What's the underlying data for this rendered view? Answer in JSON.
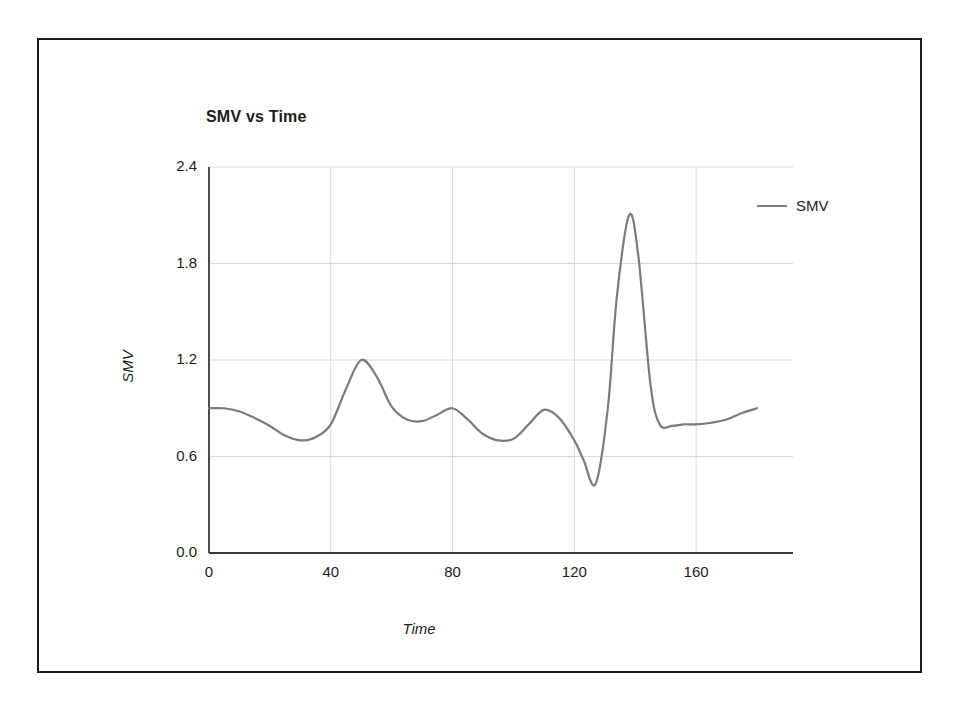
{
  "figure": {
    "title": "SMV vs Time",
    "legend": {
      "position": "top-right",
      "entries": [
        {
          "label": "SMV",
          "color": "#7b7b7b",
          "marker": "line-swatch"
        }
      ]
    }
  },
  "chart_data": {
    "type": "line",
    "title": "SMV vs Time",
    "xlabel": "Time",
    "ylabel": "SMV",
    "xlim": [
      0,
      180
    ],
    "ylim": [
      0.0,
      2.4
    ],
    "xticks": [
      "0",
      "40",
      "80",
      "120",
      "160"
    ],
    "xtick_values": [
      0,
      40,
      80,
      120,
      160
    ],
    "yticks": [
      "0.0",
      "0.6",
      "1.2",
      "1.8",
      "2.4"
    ],
    "ytick_values": [
      0.0,
      0.6,
      1.2,
      1.8,
      2.4
    ],
    "grid": true,
    "grid_color": "#d8d8d8",
    "axis_color": "#3a3a3a",
    "series": [
      {
        "name": "SMV",
        "color": "#7b7b7b",
        "line_width": 2.2,
        "x": [
          0,
          5,
          10,
          15,
          20,
          25,
          30,
          35,
          40,
          45,
          50,
          55,
          60,
          65,
          70,
          75,
          80,
          85,
          90,
          95,
          100,
          105,
          110,
          115,
          120,
          123,
          127,
          131,
          134,
          138,
          141,
          145,
          148,
          152,
          156,
          160,
          165,
          170,
          175,
          180
        ],
        "y": [
          0.9,
          0.9,
          0.88,
          0.84,
          0.79,
          0.73,
          0.7,
          0.72,
          0.8,
          1.02,
          1.2,
          1.1,
          0.91,
          0.83,
          0.82,
          0.86,
          0.9,
          0.83,
          0.74,
          0.7,
          0.71,
          0.8,
          0.89,
          0.84,
          0.7,
          0.58,
          0.43,
          0.9,
          1.6,
          2.1,
          1.85,
          1.05,
          0.8,
          0.79,
          0.8,
          0.8,
          0.81,
          0.83,
          0.87,
          0.9
        ]
      }
    ]
  }
}
